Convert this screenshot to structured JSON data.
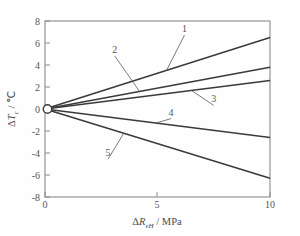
{
  "chart_data": {
    "type": "line",
    "title": "",
    "xlabel": "ΔR_eH / MPa",
    "ylabel": "ΔT_c / ℃",
    "xlim": [
      0,
      10
    ],
    "ylim": [
      -8,
      8
    ],
    "x_ticks": [
      0,
      5,
      10
    ],
    "x_tick_labels": [
      "0",
      "5",
      "10"
    ],
    "y_ticks": [
      -8,
      -6,
      -4,
      -2,
      0,
      2,
      4,
      6,
      8
    ],
    "y_tick_labels": [
      "-8",
      "-6",
      "-4",
      "-2",
      "0",
      "2",
      "4",
      "6",
      "8"
    ],
    "grid": false,
    "legend": "none",
    "origin_marker": "open-circle",
    "series": [
      {
        "name": "1",
        "x": [
          0,
          10
        ],
        "values": [
          0,
          6.5
        ],
        "slope": 0.65
      },
      {
        "name": "2",
        "x": [
          0,
          10
        ],
        "values": [
          0,
          3.8
        ],
        "slope": 0.38
      },
      {
        "name": "3",
        "x": [
          0,
          10
        ],
        "values": [
          0,
          2.6
        ],
        "slope": 0.26
      },
      {
        "name": "4",
        "x": [
          0,
          10
        ],
        "values": [
          0,
          -2.6
        ],
        "slope": -0.26
      },
      {
        "name": "5",
        "x": [
          0,
          10
        ],
        "values": [
          0,
          -6.3
        ],
        "slope": -0.63
      }
    ],
    "annotations": [
      {
        "label": "1",
        "text_x": 6.2,
        "text_y": 7.0,
        "point_x": 5.4,
        "point_y": 3.5
      },
      {
        "label": "2",
        "text_x": 3.1,
        "text_y": 5.1,
        "point_x": 4.2,
        "point_y": 1.6
      },
      {
        "label": "3",
        "text_x": 7.5,
        "text_y": 0.6,
        "point_x": 6.5,
        "point_y": 1.7
      },
      {
        "label": "4",
        "text_x": 5.6,
        "text_y": -0.6,
        "point_x": 4.9,
        "point_y": -1.3
      },
      {
        "label": "5",
        "text_x": 2.8,
        "text_y": -4.3,
        "point_x": 3.5,
        "point_y": -2.2
      }
    ]
  },
  "axis_titles": {
    "x_delta": "Δ",
    "x_symbol": "R",
    "x_subscript": "eH",
    "x_units": " / MPa",
    "y_delta": "Δ",
    "y_symbol": "T",
    "y_subscript": "c",
    "y_units": " / ℃"
  },
  "tick_labels": {
    "x": [
      "0",
      "5",
      "10"
    ],
    "y": [
      "8",
      "6",
      "4",
      "2",
      "0",
      "-2",
      "-4",
      "-6",
      "-8"
    ]
  },
  "curve_labels": [
    "1",
    "2",
    "3",
    "4",
    "5"
  ]
}
